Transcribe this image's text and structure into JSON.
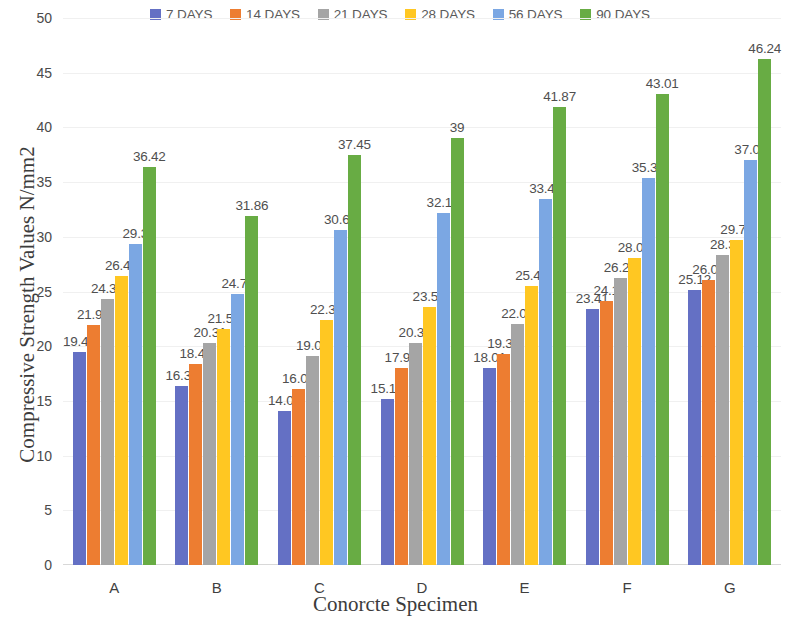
{
  "chart_data": {
    "type": "bar",
    "title": "",
    "xlabel": "Conorcte Specimen",
    "ylabel": "Compressive Strength Values N/mm2",
    "categories": [
      "A",
      "B",
      "C",
      "D",
      "E",
      "F",
      "G"
    ],
    "ylim": [
      0,
      50
    ],
    "yticks": [
      0,
      5,
      10,
      15,
      20,
      25,
      30,
      35,
      40,
      45,
      50
    ],
    "grid": true,
    "legend_position": "top",
    "series": [
      {
        "name": "7 DAYS",
        "color": "#6470c4",
        "values": [
          19.47,
          16.32,
          14.08,
          15.18,
          18.01,
          23.41,
          25.12
        ],
        "labels": [
          "19.47",
          "16.32",
          "14.08",
          "15.18",
          "18.01",
          "23.41",
          "25.12"
        ]
      },
      {
        "name": "14 DAYS",
        "color": "#ed7d31",
        "values": [
          21.91,
          18.42,
          16.06,
          17.97,
          19.32,
          24.1,
          26.01
        ],
        "labels": [
          "21.91",
          "18.42",
          "16.06",
          "17.97",
          "19.32",
          "24.1",
          "26.01"
        ]
      },
      {
        "name": "21 DAYS",
        "color": "#a5a5a5",
        "values": [
          24.31,
          20.31,
          19.07,
          20.31,
          22.04,
          26.25,
          28.3
        ],
        "labels": [
          "24.31",
          "20.31",
          "19.07",
          "20.31",
          "22.04",
          "26.25",
          "28.3"
        ]
      },
      {
        "name": "28 DAYS",
        "color": "#ffc722",
        "values": [
          26.45,
          21.54,
          22.38,
          23.58,
          25.47,
          28.06,
          29.75
        ],
        "labels": [
          "26.45",
          "21.54",
          "22.38",
          "23.58",
          "25.47",
          "28.06",
          "29.75"
        ]
      },
      {
        "name": "56 DAYS",
        "color": "#7ba7e3",
        "values": [
          29.3,
          24.78,
          30.61,
          32.16,
          33.44,
          35.38,
          37.01
        ],
        "labels": [
          "29.3",
          "24.78",
          "30.61",
          "32.16",
          "33.44",
          "35.38",
          "37.01"
        ]
      },
      {
        "name": "90 DAYS",
        "color": "#68ac44",
        "values": [
          36.42,
          31.86,
          37.45,
          39,
          41.87,
          43.01,
          46.24
        ],
        "labels": [
          "36.42",
          "31.86",
          "37.45",
          "39",
          "41.87",
          "43.01",
          "46.24"
        ]
      }
    ]
  }
}
